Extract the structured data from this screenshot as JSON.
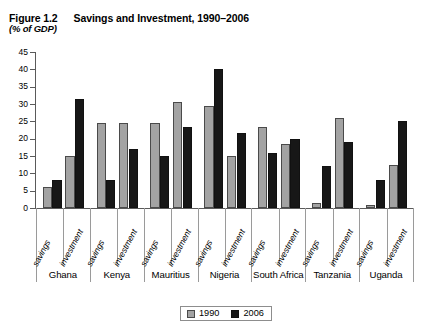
{
  "figure": {
    "number": "Figure 1.2",
    "title": "Savings and Investment, 1990–2006",
    "subtitle": "(% of GDP)"
  },
  "legend": {
    "items": [
      {
        "label": "1990",
        "color": "#a3a3a3"
      },
      {
        "label": "2006",
        "color": "#171717"
      }
    ]
  },
  "chart_data": {
    "type": "bar",
    "title": "Savings and Investment, 1990–2006",
    "subtitle": "(% of GDP)",
    "xlabel": "",
    "ylabel": "(% of GDP)",
    "ylim": [
      0,
      45
    ],
    "yticks": [
      0,
      5,
      10,
      15,
      20,
      25,
      30,
      35,
      40,
      45
    ],
    "ytick_labels": [
      "0",
      "5",
      "10",
      "15",
      "20",
      "25",
      "30",
      "35",
      "40",
      "45"
    ],
    "grid": false,
    "legend_position": "bottom-center",
    "groups": [
      "Ghana",
      "Kenya",
      "Mauritius",
      "Nigeria",
      "South Africa",
      "Tanzania",
      "Uganda"
    ],
    "subcategories": [
      "savings",
      "investment"
    ],
    "categories": [
      "Ghana savings",
      "Ghana investment",
      "Kenya savings",
      "Kenya investment",
      "Mauritius savings",
      "Mauritius investment",
      "Nigeria savings",
      "Nigeria investment",
      "South Africa savings",
      "South Africa investment",
      "Tanzania savings",
      "Tanzania investment",
      "Uganda savings",
      "Uganda investment"
    ],
    "series": [
      {
        "name": "1990",
        "color": "#a3a3a3",
        "values": [
          6,
          15,
          24.5,
          24.5,
          24.5,
          30.5,
          29.5,
          15,
          23.5,
          18.5,
          1.5,
          26,
          0.8,
          12.5
        ]
      },
      {
        "name": "2006",
        "color": "#171717",
        "values": [
          8,
          31.5,
          8,
          17,
          15,
          23.5,
          40,
          21.5,
          16,
          20,
          12,
          19,
          8,
          25
        ]
      }
    ],
    "group_data": [
      {
        "group": "Ghana",
        "savings": {
          "1990": 6,
          "2006": 8
        },
        "investment": {
          "1990": 15,
          "2006": 31.5
        }
      },
      {
        "group": "Kenya",
        "savings": {
          "1990": 24.5,
          "2006": 8
        },
        "investment": {
          "1990": 24.5,
          "2006": 17
        }
      },
      {
        "group": "Mauritius",
        "savings": {
          "1990": 24.5,
          "2006": 15
        },
        "investment": {
          "1990": 30.5,
          "2006": 23.5
        }
      },
      {
        "group": "Nigeria",
        "savings": {
          "1990": 29.5,
          "2006": 40
        },
        "investment": {
          "1990": 15,
          "2006": 21.5
        }
      },
      {
        "group": "South Africa",
        "savings": {
          "1990": 23.5,
          "2006": 16
        },
        "investment": {
          "1990": 18.5,
          "2006": 20
        }
      },
      {
        "group": "Tanzania",
        "savings": {
          "1990": 1.5,
          "2006": 12
        },
        "investment": {
          "1990": 26,
          "2006": 19
        }
      },
      {
        "group": "Uganda",
        "savings": {
          "1990": 0.8,
          "2006": 8
        },
        "investment": {
          "1990": 12.5,
          "2006": 25
        }
      }
    ]
  }
}
